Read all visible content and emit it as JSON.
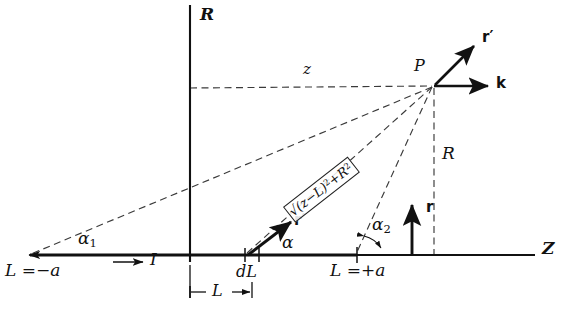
{
  "figure": {
    "type": "physics-vector-diagram",
    "background_color": "#ffffff",
    "ink_color": "#111111"
  },
  "axes": {
    "vertical": {
      "name": "R-axis",
      "label": "R",
      "x": 190,
      "top_y": 5,
      "bottom_y": 262
    },
    "horizontal": {
      "name": "Z-axis",
      "label": "Z",
      "y": 255,
      "left_x": 28,
      "right_x": 535
    }
  },
  "points": {
    "field_point": {
      "label": "P",
      "x": 434,
      "y": 86
    },
    "wire_start": {
      "label": "L = −a",
      "x": 28,
      "y": 255
    },
    "wire_end": {
      "label": "L = +a",
      "x": 357,
      "y": 255
    },
    "element": {
      "label": "dL",
      "x": 245,
      "y": 255
    }
  },
  "labels": {
    "R_axis": "R",
    "Z_axis": "Z",
    "P": "P",
    "z_distance": "z",
    "R_distance": "R",
    "L_distance": "L",
    "dL": "dL",
    "current": "I",
    "alpha": "α",
    "alpha1_base": "α",
    "alpha1_sub": "1",
    "alpha2_base": "α",
    "alpha2_sub": "2",
    "L_minus_a": "L =−a",
    "L_plus_a": "L =+a"
  },
  "vectors": [
    {
      "name": "r-prime-at-P",
      "label": "r′",
      "from": [
        434,
        86
      ],
      "to": [
        476,
        44
      ],
      "style": "bold-solid-arrow"
    },
    {
      "name": "k-at-P",
      "label": "k",
      "from": [
        434,
        86
      ],
      "to": [
        492,
        86
      ],
      "style": "bold-solid-arrow"
    },
    {
      "name": "r-vertical",
      "label": "r",
      "from": [
        412,
        255
      ],
      "to": [
        412,
        201
      ],
      "style": "bold-solid-arrow"
    },
    {
      "name": "r-prime-at-dL",
      "label": "r′",
      "from": [
        248,
        255
      ],
      "to": [
        294,
        219
      ],
      "style": "bold-solid-arrow"
    },
    {
      "name": "current-direction",
      "label": "I",
      "from": [
        113,
        262
      ],
      "to": [
        146,
        262
      ],
      "style": "thin-solid-arrow"
    }
  ],
  "expression": {
    "name": "distance-formula",
    "radical": "√",
    "text": "(z−L)",
    "exp1": "2",
    "plus": "+R",
    "exp2": "2",
    "full": "√((z−L)²+R²)",
    "rotation_deg": -38
  },
  "dashed_lines": [
    {
      "name": "z-horizontal-to-P",
      "from": [
        190,
        88
      ],
      "to": [
        434,
        86
      ]
    },
    {
      "name": "R-vertical-from-P",
      "from": [
        434,
        86
      ],
      "to": [
        434,
        255
      ]
    },
    {
      "name": "P-to-wire-start",
      "from": [
        434,
        86
      ],
      "to": [
        30,
        255
      ]
    },
    {
      "name": "P-to-dL",
      "from": [
        434,
        86
      ],
      "to": [
        247,
        255
      ]
    },
    {
      "name": "P-to-wire-end",
      "from": [
        434,
        86
      ],
      "to": [
        357,
        255
      ]
    }
  ],
  "angles": [
    {
      "name": "alpha",
      "vertex": [
        248,
        255
      ],
      "label": "α"
    },
    {
      "name": "alpha1",
      "vertex": [
        30,
        255
      ],
      "label": "α₁"
    },
    {
      "name": "alpha2",
      "vertex": [
        357,
        255
      ],
      "label": "α₂"
    }
  ],
  "dimension": {
    "name": "L-measure",
    "label": "L",
    "from_x": 190,
    "to_x": 252,
    "y": 292
  }
}
